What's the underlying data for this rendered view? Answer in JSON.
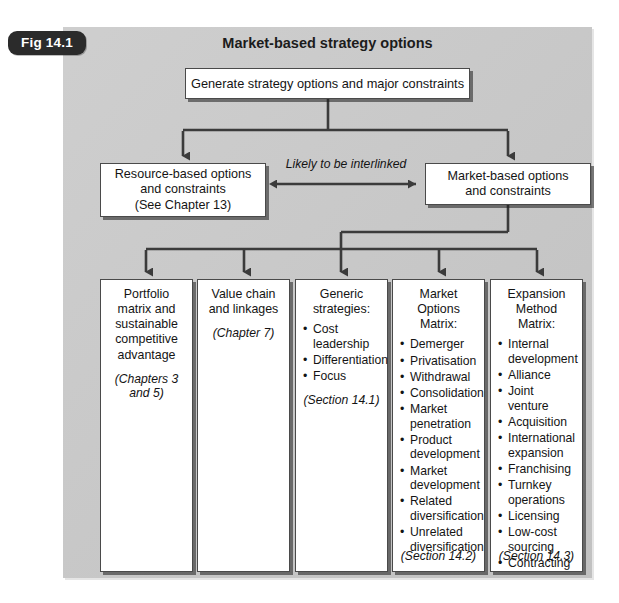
{
  "figure": {
    "label": "Fig 14.1",
    "title": "Market-based strategy options"
  },
  "nodes": {
    "generate": "Generate strategy options and major constraints",
    "resource": {
      "line1": "Resource-based options",
      "line2": "and constraints",
      "line3": "(See Chapter 13)"
    },
    "market": {
      "line1": "Market-based options",
      "line2": "and constraints"
    },
    "interlink_label": "Likely to be interlinked"
  },
  "columns": [
    {
      "id": "portfolio",
      "head": "Portfolio matrix and sustainable competitive advantage",
      "note": "(Chapters 3 and 5)",
      "bullets": [],
      "footer": ""
    },
    {
      "id": "value-chain",
      "head": "Value chain and linkages",
      "note": "(Chapter 7)",
      "bullets": [],
      "footer": ""
    },
    {
      "id": "generic-strategies",
      "head": "Generic strategies:",
      "note": "",
      "bullets": [
        "Cost leadership",
        "Differentiation",
        "Focus"
      ],
      "inline_note": "(Section 14.1)",
      "footer": ""
    },
    {
      "id": "market-options-matrix",
      "head": "Market Options Matrix:",
      "note": "",
      "bullets": [
        "Demerger",
        "Privatisation",
        "Withdrawal",
        "Consolidation",
        "Market penetration",
        "Product development",
        "Market development",
        "Related diversification",
        "Unrelated diversification"
      ],
      "footer": "(Section 14.2)"
    },
    {
      "id": "expansion-method-matrix",
      "head": "Expansion Method Matrix:",
      "note": "",
      "bullets": [
        "Internal development",
        "Alliance",
        "Joint venture",
        "Acquisition",
        "International expansion",
        "Franchising",
        "Turnkey operations",
        "Licensing",
        "Low-cost sourcing",
        "Contracting"
      ],
      "footer": "(Section 14.3)"
    }
  ],
  "colors": {
    "panel": "#c9c9c9",
    "box_fill": "#ffffff",
    "line": "#3b3b3b",
    "pill": "#2b2b2b",
    "text": "#141414"
  }
}
